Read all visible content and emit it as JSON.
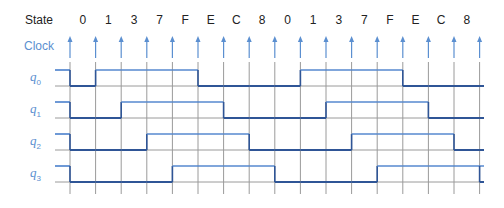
{
  "title_label": "State",
  "clock_label": "Clock",
  "states": [
    "0",
    "1",
    "3",
    "7",
    "F",
    "E",
    "C",
    "8",
    "0",
    "1",
    "3",
    "7",
    "F",
    "E",
    "C",
    "8"
  ],
  "signals": [
    {
      "name": "q",
      "sub": "0",
      "values": [
        0,
        1,
        1,
        1,
        1,
        0,
        0,
        0,
        0,
        1,
        1,
        1,
        1,
        0,
        0,
        0
      ]
    },
    {
      "name": "q",
      "sub": "1",
      "values": [
        0,
        0,
        1,
        1,
        1,
        1,
        0,
        0,
        0,
        0,
        1,
        1,
        1,
        1,
        0,
        0
      ]
    },
    {
      "name": "q",
      "sub": "2",
      "values": [
        0,
        0,
        0,
        1,
        1,
        1,
        1,
        0,
        0,
        0,
        0,
        1,
        1,
        1,
        1,
        0
      ]
    },
    {
      "name": "q",
      "sub": "3",
      "values": [
        0,
        0,
        0,
        0,
        1,
        1,
        1,
        1,
        0,
        0,
        0,
        0,
        1,
        1,
        1,
        1
      ]
    }
  ],
  "colors": {
    "grid": "#9a9a9a",
    "clock_arrow": "#5b8fd0",
    "wave_high": "#4a80cc",
    "wave_low": "#2f5596",
    "label_blue": "#5b8fd0",
    "text": "#222222"
  },
  "layout": {
    "first_edge_x": 70,
    "edge_spacing": 25.6,
    "edge_count": 17,
    "state_label_y": 24,
    "clock_label_y": 50,
    "arrow_top": 36,
    "arrow_bottom": 58,
    "grid_top": 62,
    "grid_bottom": 194,
    "stub_start_x": 55,
    "wave_end_x": 484,
    "signal_high_y": [
      70,
      102,
      134,
      166
    ],
    "signal_low_y": [
      86,
      118,
      150,
      182
    ]
  }
}
